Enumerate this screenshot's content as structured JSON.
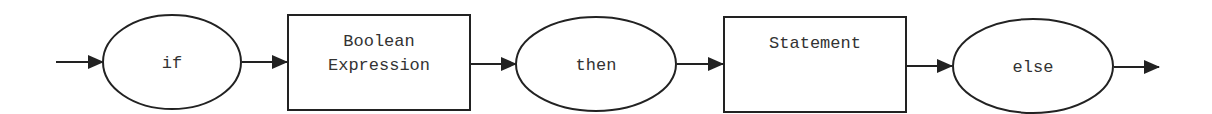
{
  "diagram": {
    "type": "syntax-flow",
    "nodes": [
      {
        "id": "if",
        "shape": "ellipse",
        "lines": [
          "if"
        ]
      },
      {
        "id": "bool",
        "shape": "rect",
        "lines": [
          "Boolean",
          "Expression"
        ]
      },
      {
        "id": "then",
        "shape": "ellipse",
        "lines": [
          "then"
        ]
      },
      {
        "id": "stmt",
        "shape": "rect",
        "lines": [
          "Statement"
        ]
      },
      {
        "id": "else",
        "shape": "ellipse",
        "lines": [
          "else"
        ]
      }
    ],
    "edges": [
      {
        "from": "start",
        "to": "if"
      },
      {
        "from": "if",
        "to": "bool"
      },
      {
        "from": "bool",
        "to": "then"
      },
      {
        "from": "then",
        "to": "stmt"
      },
      {
        "from": "stmt",
        "to": "else"
      },
      {
        "from": "else",
        "to": "end"
      }
    ],
    "colors": {
      "stroke": "#222222",
      "text": "#333333",
      "background": "#ffffff"
    }
  }
}
